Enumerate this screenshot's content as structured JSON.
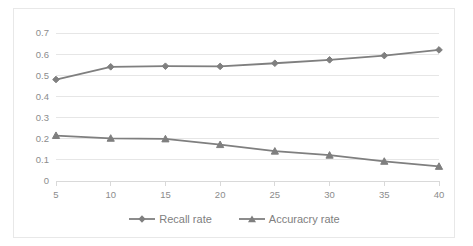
{
  "chart_data": {
    "type": "line",
    "title": "",
    "xlabel": "",
    "ylabel": "",
    "categories": [
      "5",
      "10",
      "15",
      "20",
      "25",
      "30",
      "35",
      "40"
    ],
    "x": [
      5,
      10,
      15,
      20,
      25,
      30,
      35,
      40
    ],
    "xlim": [
      5,
      40
    ],
    "ylim": [
      0,
      0.7
    ],
    "ytick_labels": [
      "0.7",
      "0.6",
      "0.5",
      "0.4",
      "0.3",
      "0.2",
      "0.1",
      "0"
    ],
    "ytick_values": [
      0.7,
      0.6,
      0.5,
      0.4,
      0.3,
      0.2,
      0.1,
      0
    ],
    "grid": true,
    "legend_position": "bottom",
    "series": [
      {
        "name": "Recall rate",
        "marker": "diamond",
        "color": "#7f7f7f",
        "values": [
          0.48,
          0.54,
          0.543,
          0.542,
          0.557,
          0.573,
          0.593,
          0.62
        ]
      },
      {
        "name": "Accuracry rate",
        "marker": "triangle",
        "color": "#7f7f7f",
        "values": [
          0.215,
          0.202,
          0.199,
          0.172,
          0.141,
          0.122,
          0.093,
          0.069
        ]
      }
    ]
  },
  "legend": {
    "items": [
      {
        "label": "Recall rate"
      },
      {
        "label": "Accuracry rate"
      }
    ]
  },
  "colors": {
    "series": "#7f7f7f",
    "gridline": "#e6e6e6",
    "axis": "#d9d9d9",
    "tick_text": "#8c8c8c",
    "legend_text": "#808080",
    "border": "#e8e8e8",
    "background": "#ffffff"
  }
}
